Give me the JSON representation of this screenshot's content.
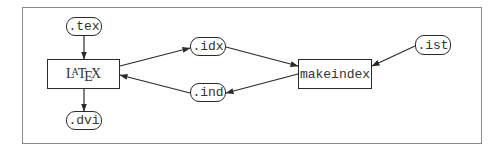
{
  "diagram": {
    "nodes": {
      "tex": {
        "label": ".tex",
        "kind": "file"
      },
      "latex": {
        "label": "LaTeX",
        "kind": "process",
        "parts": [
          "L",
          "A",
          "T",
          "E",
          "X"
        ]
      },
      "dvi": {
        "label": ".dvi",
        "kind": "file"
      },
      "idx": {
        "label": ".idx",
        "kind": "file"
      },
      "ind": {
        "label": ".ind",
        "kind": "file"
      },
      "makeindex": {
        "label": "makeindex",
        "kind": "process"
      },
      "ist": {
        "label": ".ist",
        "kind": "file"
      }
    },
    "edges": [
      {
        "from": ".tex",
        "to": "LaTeX"
      },
      {
        "from": "LaTeX",
        "to": ".dvi"
      },
      {
        "from": "LaTeX",
        "to": ".idx"
      },
      {
        "from": ".idx",
        "to": "makeindex"
      },
      {
        "from": ".ist",
        "to": "makeindex"
      },
      {
        "from": "makeindex",
        "to": ".ind"
      },
      {
        "from": ".ind",
        "to": "LaTeX"
      }
    ],
    "colors": {
      "stroke": "#2a2a2a",
      "frame": "#8a8a8a",
      "text": "#333333"
    }
  }
}
